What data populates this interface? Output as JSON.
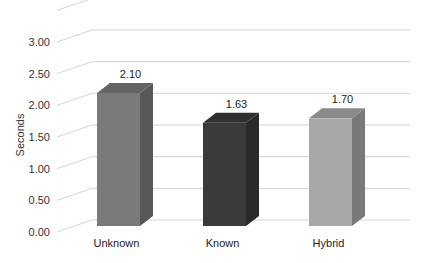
{
  "chart_data": {
    "type": "bar",
    "title": "",
    "xlabel": "",
    "ylabel": "Seconds",
    "ylim": [
      0,
      3.5
    ],
    "yticks": [
      "0.00",
      "0.50",
      "1.00",
      "1.50",
      "2.00",
      "2.50",
      "3.00"
    ],
    "categories": [
      "Unknown",
      "Known",
      "Hybrid"
    ],
    "values": [
      2.1,
      1.63,
      1.7
    ],
    "value_labels": [
      "2.10",
      "1.63",
      "1.70"
    ],
    "colors": [
      "#7a7a7a",
      "#3a3a3a",
      "#a8a8a8"
    ],
    "grid": true,
    "legend": "none",
    "style": "3d-column"
  }
}
